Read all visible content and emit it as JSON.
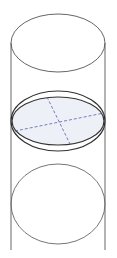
{
  "diagram": {
    "colors": {
      "outline": "#555555",
      "disc_outline": "#333333",
      "disc_fill": "#eef0f8",
      "dashed_lines": "#5560a8",
      "background": "#ffffff"
    },
    "shapes": {
      "top_ellipse": {
        "cx": 58,
        "cy": 43,
        "rx": 47,
        "ry": 29
      },
      "bottom_ellipse": {
        "cx": 58,
        "cy": 204,
        "rx": 47,
        "ry": 40
      },
      "disc_outer": {
        "cx": 58,
        "cy": 120,
        "rx": 47,
        "ry": 29
      },
      "disc_inner": {
        "cx": 58,
        "cy": 122,
        "rx": 46,
        "ry": 24
      },
      "left_wall_x": 11,
      "right_wall_x": 105,
      "walls_top_y": 43,
      "walls_bottom_y": 250,
      "diameter_1": {
        "x1": 47,
        "y1": 97,
        "x2": 71,
        "y2": 148
      },
      "diameter_2": {
        "x1": 15,
        "y1": 131,
        "x2": 104,
        "y2": 113
      }
    }
  }
}
